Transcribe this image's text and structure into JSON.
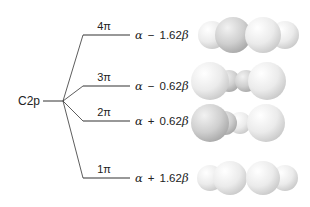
{
  "diagram": {
    "atomic_orbital": {
      "label": "C2p"
    },
    "levels": [
      {
        "id": "4pi",
        "label": "4π",
        "alpha": "α",
        "sign": "−",
        "coef": "1.62",
        "beta": "β",
        "y": 35,
        "orbital_shape": "four-lobes-outer-small"
      },
      {
        "id": "3pi",
        "label": "3π",
        "alpha": "α",
        "sign": "−",
        "coef": "0.62",
        "beta": "β",
        "y": 86,
        "orbital_shape": "large-outer-small-inner"
      },
      {
        "id": "2pi",
        "label": "2π",
        "alpha": "α",
        "sign": "+",
        "coef": "0.62",
        "beta": "β",
        "y": 121,
        "orbital_shape": "large-outer-small-inner-shaded"
      },
      {
        "id": "1pi",
        "label": "1π",
        "alpha": "α",
        "sign": "+",
        "coef": "1.62",
        "beta": "β",
        "y": 178,
        "orbital_shape": "four-lobes-continuous"
      }
    ],
    "colors": {
      "line": "#333333",
      "text": "#222222",
      "orbital_light": "#f4f4f4",
      "orbital_shade": "#b8b8b8"
    }
  }
}
